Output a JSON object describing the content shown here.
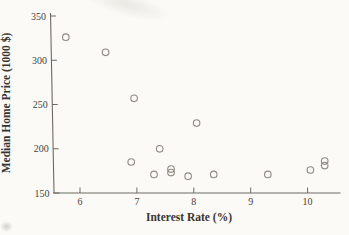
{
  "colors": {
    "background": "#fbfaf7",
    "axis_line": "#6e6a63",
    "marker_stroke": "#8e8a83",
    "text_ink": "#46423c"
  },
  "chart_data": {
    "type": "scatter",
    "title": "",
    "xlabel": "Interest Rate (%)",
    "ylabel": "Median Home Price (1000 $)",
    "xlim": [
      5.5,
      10.55
    ],
    "ylim": [
      150,
      350
    ],
    "x_ticks": [
      6,
      7,
      8,
      9,
      10
    ],
    "y_ticks": [
      150,
      200,
      250,
      300,
      350
    ],
    "grid": false,
    "legend": "none",
    "marker": "open-circle",
    "points": [
      {
        "x": 5.75,
        "y": 326
      },
      {
        "x": 6.45,
        "y": 309
      },
      {
        "x": 6.9,
        "y": 185
      },
      {
        "x": 6.95,
        "y": 257
      },
      {
        "x": 7.3,
        "y": 171
      },
      {
        "x": 7.4,
        "y": 200
      },
      {
        "x": 7.6,
        "y": 173
      },
      {
        "x": 7.6,
        "y": 177
      },
      {
        "x": 7.9,
        "y": 169
      },
      {
        "x": 8.05,
        "y": 229
      },
      {
        "x": 8.35,
        "y": 171
      },
      {
        "x": 9.3,
        "y": 171
      },
      {
        "x": 10.05,
        "y": 176
      },
      {
        "x": 10.3,
        "y": 181
      },
      {
        "x": 10.3,
        "y": 186
      }
    ]
  }
}
